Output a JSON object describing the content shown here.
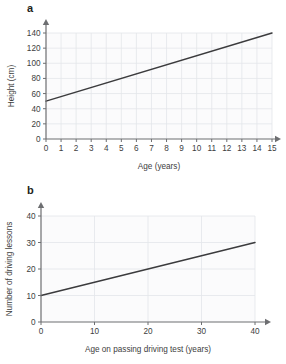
{
  "charts": [
    {
      "panel_letter": "a",
      "chart_data": {
        "type": "line",
        "title": "",
        "xlabel": "Age (years)",
        "ylabel": "Height (cm)",
        "xlim": [
          0,
          15
        ],
        "ylim": [
          0,
          140
        ],
        "xticks": [
          0,
          1,
          2,
          3,
          4,
          5,
          6,
          7,
          8,
          9,
          10,
          11,
          12,
          13,
          14,
          15
        ],
        "yticks": [
          0,
          20,
          40,
          60,
          80,
          100,
          120,
          140
        ],
        "grid": true,
        "legend": "none",
        "series": [
          {
            "name": "height-vs-age",
            "points": [
              [
                0,
                50
              ],
              [
                15,
                140
              ]
            ]
          }
        ]
      }
    },
    {
      "panel_letter": "b",
      "chart_data": {
        "type": "line",
        "title": "",
        "xlabel": "Age on passing driving test (years)",
        "ylabel": "Number of driving lessons",
        "xlim": [
          0,
          40
        ],
        "ylim": [
          0,
          40
        ],
        "xticks": [
          0,
          10,
          20,
          30,
          40
        ],
        "yticks": [
          0,
          10,
          20,
          30,
          40
        ],
        "grid": true,
        "legend": "none",
        "series": [
          {
            "name": "lessons-vs-age",
            "points": [
              [
                0,
                10
              ],
              [
                40,
                30
              ]
            ]
          }
        ]
      }
    }
  ],
  "colors": {
    "data_line": "#3b3b3d",
    "axis": "#6d6e71",
    "grid": "#e3e6ea",
    "plot_background": "#fbfbfc",
    "page_background": "#ffffff",
    "text": "#404040"
  }
}
